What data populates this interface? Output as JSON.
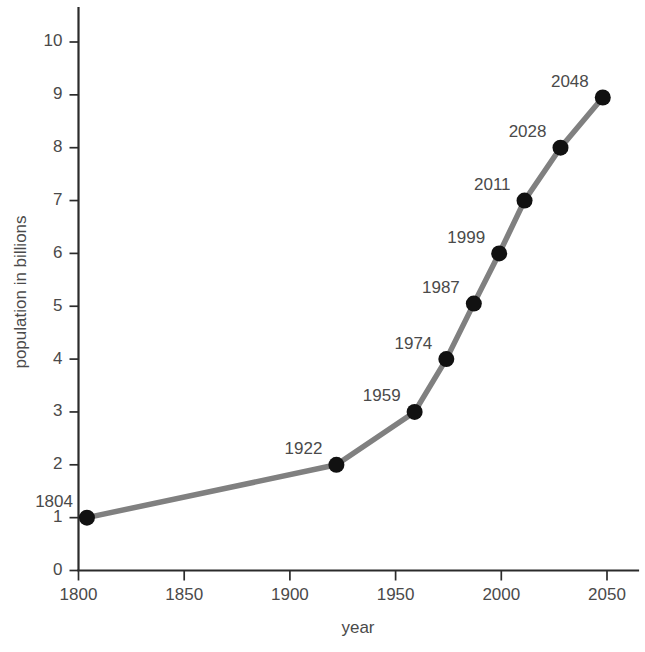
{
  "chart_data": {
    "type": "line",
    "title": "",
    "xlabel": "year",
    "ylabel": "population in billions",
    "xlim": [
      1790,
      2065
    ],
    "ylim": [
      0,
      10.6
    ],
    "grid": false,
    "legend": null,
    "x_ticks": [
      1800,
      1850,
      1900,
      1950,
      2000,
      2050
    ],
    "x_tick_labels": [
      "1800",
      "1850",
      "1900",
      "1950",
      "2000",
      "2050"
    ],
    "y_ticks": [
      0,
      1,
      2,
      3,
      4,
      5,
      6,
      7,
      8,
      9,
      10
    ],
    "y_tick_labels": [
      "0",
      "1",
      "2",
      "3",
      "4",
      "5",
      "6",
      "7",
      "8",
      "9",
      "10"
    ],
    "series": [
      {
        "name": "world population",
        "line_color": "#808080",
        "marker_color": "#111111",
        "x": [
          1804,
          1922,
          1959,
          1974,
          1987,
          1999,
          2011,
          2028,
          2048
        ],
        "y": [
          1.0,
          2.0,
          3.0,
          4.0,
          5.05,
          6.0,
          7.0,
          8.0,
          8.95
        ],
        "point_labels": [
          "1804",
          "1922",
          "1959",
          "1974",
          "1987",
          "1999",
          "2011",
          "2028",
          "2048"
        ]
      }
    ]
  }
}
